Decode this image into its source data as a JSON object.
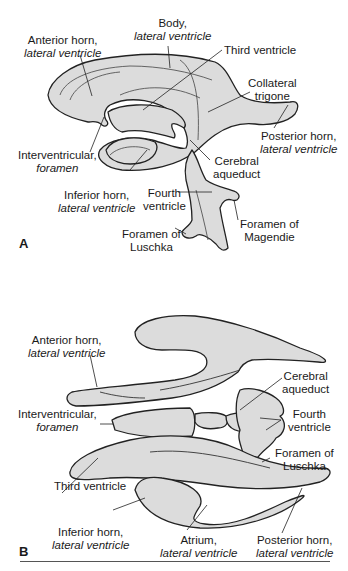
{
  "figure": {
    "fill_color": "#dcdcdc",
    "stroke_color": "#222222",
    "panels": [
      {
        "letter": "A",
        "view": "lateral",
        "labels": {
          "anterior_horn": {
            "line1": "Anterior horn,",
            "line2": "lateral ventricle"
          },
          "body": {
            "line1": "Body,",
            "line2": "lateral ventricle"
          },
          "third_ventricle": {
            "line1": "Third ventricle"
          },
          "collateral_trigone": {
            "line1": "Collateral",
            "line2": "trigone"
          },
          "posterior_horn": {
            "line1": "Posterior horn,",
            "line2": "lateral ventricle"
          },
          "interventricular_foramen": {
            "line1": "Interventricular,",
            "line2": "foramen"
          },
          "cerebral_aqueduct": {
            "line1": "Cerebral",
            "line2": "aqueduct"
          },
          "inferior_horn": {
            "line1": "Inferior horn,",
            "line2": "lateral ventricle"
          },
          "fourth_ventricle": {
            "line1": "Fourth",
            "line2": "ventricle"
          },
          "foramen_magendie": {
            "line1": "Foramen of",
            "line2": "Magendie"
          },
          "foramen_luschka": {
            "line1": "Foramen of",
            "line2": "Luschka"
          }
        }
      },
      {
        "letter": "B",
        "view": "superior",
        "labels": {
          "anterior_horn": {
            "line1": "Anterior horn,",
            "line2": "lateral ventricle"
          },
          "cerebral_aqueduct": {
            "line1": "Cerebral",
            "line2": "aqueduct"
          },
          "interventricular_foramen": {
            "line1": "Interventricular,",
            "line2": "foramen"
          },
          "fourth_ventricle": {
            "line1": "Fourth",
            "line2": "ventricle"
          },
          "foramen_luschka": {
            "line1": "Foramen of",
            "line2": "Luschka"
          },
          "third_ventricle": {
            "line1": "Third ventricle"
          },
          "inferior_horn": {
            "line1": "Inferior horn,",
            "line2": "lateral ventricle"
          },
          "atrium": {
            "line1": "Atrium,",
            "line2": "lateral ventricle"
          },
          "posterior_horn": {
            "line1": "Posterior horn,",
            "line2": "lateral ventricle"
          }
        }
      }
    ]
  }
}
